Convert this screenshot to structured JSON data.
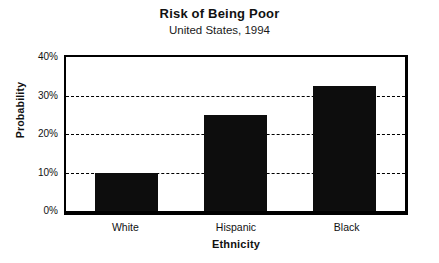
{
  "chart_data": {
    "type": "bar",
    "title": "Risk of Being Poor",
    "subtitle": "United States, 1994",
    "xlabel": "Ethnicity",
    "ylabel": "Probability",
    "categories": [
      "White",
      "Hispanic",
      "Black"
    ],
    "values": [
      10,
      25,
      32.5
    ],
    "value_labels": [
      "10%",
      "25%",
      "32.5%"
    ],
    "ylim": [
      0,
      40
    ],
    "ytick_values": [
      0,
      10,
      20,
      30,
      40
    ],
    "ytick_labels": [
      "0%",
      "10%",
      "20%",
      "30%",
      "40%"
    ],
    "grid": true,
    "gridline_values": [
      10,
      20,
      30
    ],
    "legend": null,
    "legend_position": "none",
    "bar_color": "#0d0d0d",
    "background_color": "#ffffff",
    "axis_color": "#000000"
  }
}
